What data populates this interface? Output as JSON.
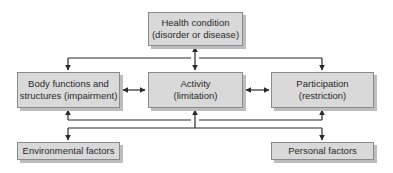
{
  "diagram": {
    "nodes": {
      "health_condition": {
        "line1": "Health condition",
        "line2": "(disorder or disease)"
      },
      "body_functions": {
        "line1": "Body functions and",
        "line2": "structures (impairment)"
      },
      "activity": {
        "line1": "Activity",
        "line2": "(limitation)"
      },
      "participation": {
        "line1": "Participation",
        "line2": "(restriction)"
      },
      "environmental_factors": {
        "line1": "Environmental factors"
      },
      "personal_factors": {
        "line1": "Personal factors"
      }
    },
    "edges": [
      {
        "from": "health_condition",
        "to": "activity",
        "type": "bidirectional"
      },
      {
        "from": "health_condition",
        "to": "body_functions",
        "type": "directed"
      },
      {
        "from": "health_condition",
        "to": "participation",
        "type": "directed"
      },
      {
        "from": "body_functions",
        "to": "activity",
        "type": "bidirectional"
      },
      {
        "from": "activity",
        "to": "participation",
        "type": "bidirectional"
      },
      {
        "from": "activity",
        "to": "body_functions",
        "type": "directed"
      },
      {
        "from": "activity",
        "to": "participation",
        "type": "directed"
      },
      {
        "from": "activity",
        "to": "environmental_factors",
        "type": "directed"
      },
      {
        "from": "activity",
        "to": "personal_factors",
        "type": "directed"
      }
    ],
    "colors": {
      "box_fill": "#d9d9d9",
      "box_border": "#8a8a8a",
      "box_shadow": "#bdbdbd",
      "line": "#2a2a2a",
      "text": "#2a2a2a"
    }
  }
}
